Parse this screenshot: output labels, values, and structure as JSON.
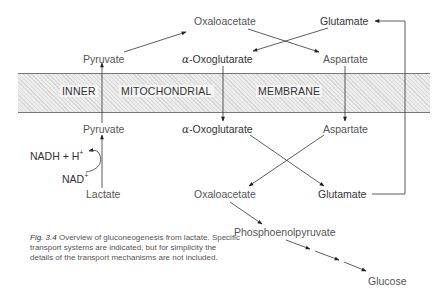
{
  "membrane": {
    "labels": [
      "INNER",
      "MITOCHONDRIAL",
      "MEMBRANE"
    ]
  },
  "cytosol_top": {
    "oxaloacetate": "Oxaloacetate",
    "glutamate": "Glutamate",
    "pyruvate": "Pyruvate",
    "alpha": "α",
    "oxoglutarate": "-Oxoglutarate",
    "aspartate": "Aspartate"
  },
  "matrix_bottom": {
    "pyruvate": "Pyruvate",
    "alpha": "α",
    "oxoglutarate": "-Oxoglutarate",
    "aspartate": "Aspartate",
    "nadh": "NADH + H",
    "nadh_sup": "+",
    "nad": "NAD",
    "nad_sup": "+",
    "lactate": "Lactate",
    "oxaloacetate": "Oxaloacetate",
    "glutamate": "Glutamate",
    "pep": "Phosphoenolpyruvate",
    "glucose": "Glucose"
  },
  "caption": {
    "fig_label": "Fig. 3.4",
    "text": " Overview of gluconeogenesis from lactate. Specific transport systems are indicated, but for simplicity the details of the transport mechanisms are not included."
  },
  "colors": {
    "line": "#333333",
    "membrane_fill": "#ececec",
    "text": "#555555"
  }
}
